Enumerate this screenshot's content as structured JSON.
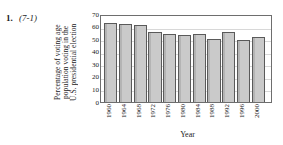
{
  "problem": {
    "number": "1.",
    "reference": "(7-1)"
  },
  "chart_data": {
    "type": "bar",
    "title": "",
    "xlabel": "Year",
    "ylabel": "Percentage of voting age population voting in the U.S. presidential election",
    "ylabel_lines": [
      "Percentage of voting age",
      "population voting in the",
      "U.S. presidential election"
    ],
    "categories": [
      "1960",
      "1964",
      "1968",
      "1972",
      "1976",
      "1980",
      "1984",
      "1988",
      "1992",
      "1996",
      "2000"
    ],
    "values": [
      63,
      62,
      61,
      55.5,
      54,
      53.5,
      54,
      50.5,
      56,
      49.5,
      51.5
    ],
    "ylim": [
      0,
      70
    ],
    "yticks": [
      70,
      60,
      50,
      40,
      30,
      20,
      10,
      0
    ],
    "grid": true,
    "legend": "none",
    "colors": {
      "bar_fill": "#c6c6c6",
      "bar_edge": "#5a5a5a",
      "frame": "#6e6e6e",
      "grid": "#d8d8d8",
      "text": "#1a1a1a",
      "background": "#ffffff"
    }
  }
}
